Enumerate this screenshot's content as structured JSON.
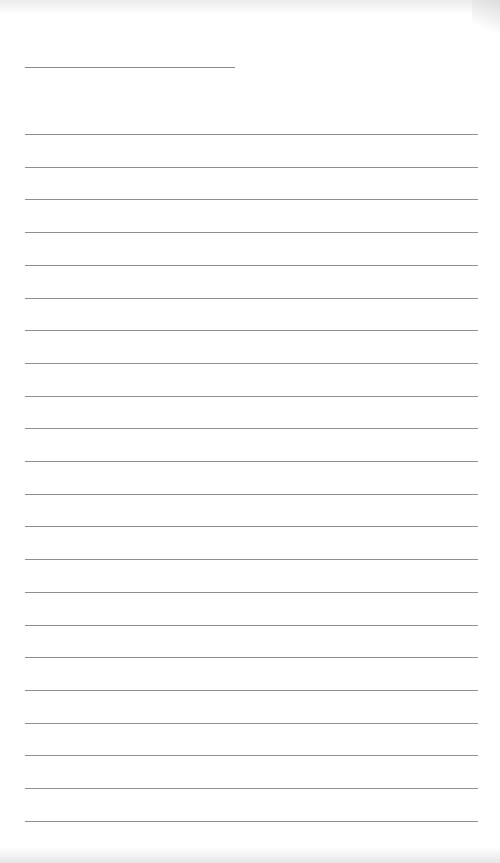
{
  "page": {
    "type": "lined-paper",
    "background": "#ffffff",
    "line_color": "#8e8e8e",
    "header_line": {
      "top": 67,
      "left": 25,
      "width": 210
    },
    "rules": {
      "count": 22,
      "first_top": 134,
      "spacing": 32.7,
      "left": 25,
      "width": 453
    }
  }
}
